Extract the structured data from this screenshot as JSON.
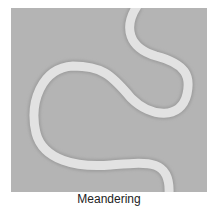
{
  "caption": "Meandering",
  "colors": {
    "background": "#b4b4b4",
    "channel": "#e4e4e4",
    "page": "#ffffff"
  }
}
